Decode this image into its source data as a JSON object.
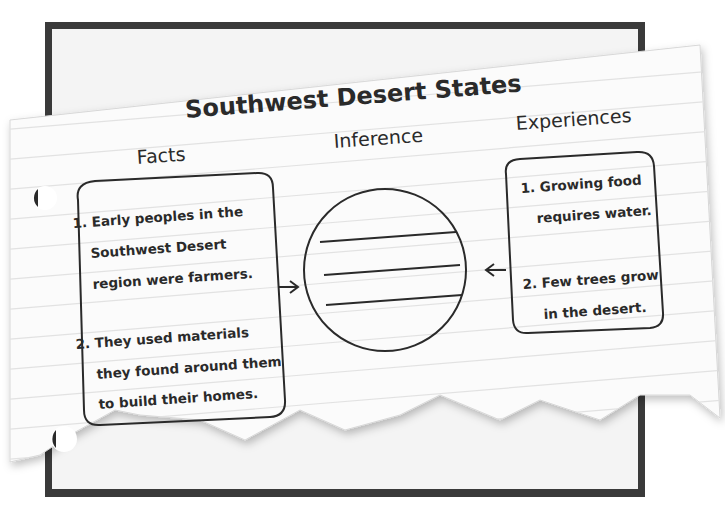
{
  "title": "Southwest Desert States",
  "columns": {
    "facts": "Facts",
    "inference": "Inference",
    "experiences": "Experiences"
  },
  "facts": {
    "item1": {
      "line1": "1. Early peoples in the",
      "line2": "Southwest Desert",
      "line3": "region were farmers."
    },
    "item2": {
      "line1": "2. They used materials",
      "line2": "they found around them",
      "line3": "to build their homes."
    }
  },
  "experiences": {
    "item1": {
      "line1": "1. Growing food",
      "line2": "requires water."
    },
    "item2": {
      "line1": "2. Few trees grow",
      "line2": "in the desert."
    }
  },
  "inference": {
    "blank_lines": 3
  },
  "colors": {
    "frame": "#3a3a3a",
    "paper": "#fbfbfb",
    "rule_line": "#e4e4e4",
    "ink": "#2a2a2a"
  }
}
